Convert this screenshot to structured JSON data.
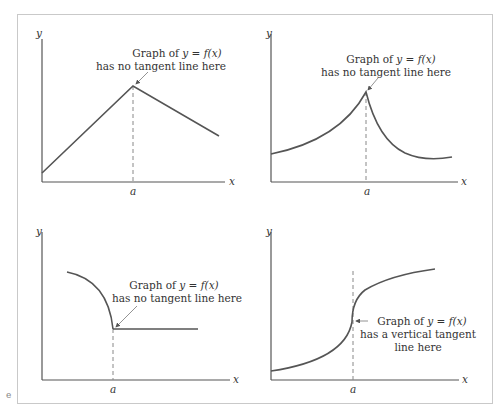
{
  "figure": {
    "panels": [
      {
        "id": "top-left",
        "y_label": "y",
        "x_label": "x",
        "tick_label": "a",
        "annotation_line1_prefix": "Graph of ",
        "annotation_line1_math": "y = f(x)",
        "annotation_line2": "has no tangent line here",
        "annotation_line3": ""
      },
      {
        "id": "top-right",
        "y_label": "y",
        "x_label": "x",
        "tick_label": "a",
        "annotation_line1_prefix": "Graph of ",
        "annotation_line1_math": "y = f(x)",
        "annotation_line2": "has no tangent line here",
        "annotation_line3": ""
      },
      {
        "id": "bottom-left",
        "y_label": "y",
        "x_label": "x",
        "tick_label": "a",
        "annotation_line1_prefix": "Graph of ",
        "annotation_line1_math": "y = f(x)",
        "annotation_line2": "has no tangent line here",
        "annotation_line3": ""
      },
      {
        "id": "bottom-right",
        "y_label": "y",
        "x_label": "x",
        "tick_label": "a",
        "annotation_line1_prefix": "Graph of ",
        "annotation_line1_math": "y = f(x)",
        "annotation_line2": "has a vertical tangent",
        "annotation_line3": "line here"
      }
    ],
    "stray_mark": "e",
    "colors": {
      "curve": "#555555",
      "axis": "#555555",
      "dashed": "#888888",
      "text": "#333333",
      "frame": "#c9c9c9"
    }
  }
}
